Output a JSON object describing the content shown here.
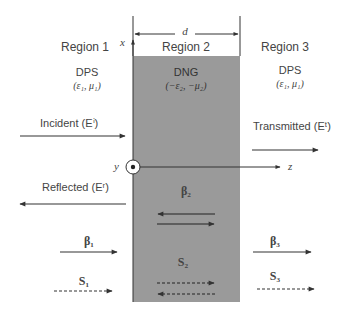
{
  "regions": [
    {
      "name": "Region 1",
      "material": "DPS",
      "params": "(ε₁, μ₁)"
    },
    {
      "name": "Region 2",
      "material": "DNG",
      "params": "(−ε₂, −μ₂)"
    },
    {
      "name": "Region 3",
      "material": "DPS",
      "params": "(ε₁, μ₁)"
    }
  ],
  "axes": {
    "x": "x",
    "y": "y",
    "z": "z"
  },
  "thickness_label": "d",
  "waves": {
    "incident": "Incident (Eⁱ)",
    "reflected": "Reflected (Eʳ)",
    "transmitted": "Transmitted (Eᵗ)"
  },
  "vectors": {
    "beta1": "β₁",
    "beta2": "β₂",
    "beta3": "β₃",
    "s1": "S₁",
    "s2": "S₂",
    "s3": "S₃"
  },
  "colors": {
    "slab": "#9a9a9a",
    "line": "#333333"
  }
}
